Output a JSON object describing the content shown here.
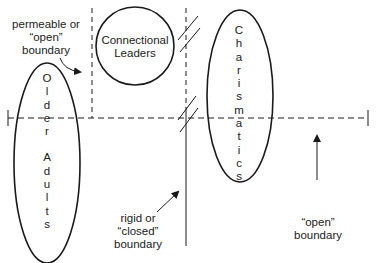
{
  "diagram": {
    "groups": {
      "older_adults": {
        "label": "Older Adults",
        "letters": [
          "O",
          "l",
          "d",
          "e",
          "r",
          "",
          "A",
          "d",
          "u",
          "l",
          "t",
          "s"
        ]
      },
      "connectional_leaders": {
        "line1": "Connectional",
        "line2": "Leaders"
      },
      "charismatics": {
        "label": "Charismatics",
        "letters": [
          "C",
          "h",
          "a",
          "r",
          "i",
          "s",
          "m",
          "a",
          "t",
          "i",
          "c",
          "s"
        ]
      }
    },
    "annotations": {
      "permeable": {
        "line1": "permeable or",
        "line2": "“open”",
        "line3": "boundary"
      },
      "rigid": {
        "line1": "rigid or",
        "line2": "“closed”",
        "line3": "boundary"
      },
      "open": {
        "line1": "“open”",
        "line2": "boundary"
      }
    },
    "colors": {
      "stroke": "#1a1a1a",
      "background": "#ffffff"
    }
  }
}
